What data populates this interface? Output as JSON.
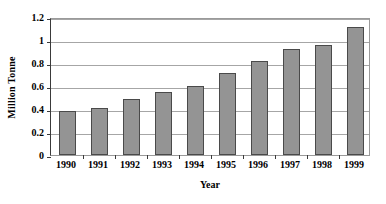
{
  "chart_data": {
    "type": "bar",
    "title": "",
    "xlabel": "Year",
    "ylabel": "Million Tonne",
    "categories": [
      "1990",
      "1991",
      "1992",
      "1993",
      "1994",
      "1995",
      "1996",
      "1997",
      "1998",
      "1999"
    ],
    "values": [
      0.385,
      0.405,
      0.49,
      0.55,
      0.6,
      0.71,
      0.815,
      0.925,
      0.96,
      1.11
    ],
    "series": [
      {
        "name": "Million Tonne",
        "values": [
          0.385,
          0.405,
          0.49,
          0.55,
          0.6,
          0.71,
          0.815,
          0.925,
          0.96,
          1.11
        ]
      }
    ],
    "ylim": [
      0,
      1.2
    ],
    "ytick_values": [
      0,
      0.2,
      0.4,
      0.6,
      0.8,
      1,
      1.2
    ],
    "ytick_labels": [
      "0",
      "0.2",
      "0.4",
      "0.6",
      "0.8",
      "1",
      "1.2"
    ],
    "grid": "horizontal",
    "legend": "none",
    "bar_color": "#949494",
    "bar_border_color": "#4a4a4a",
    "gridline_color": "#a6a6a6",
    "axis_color": "#3a3a3a",
    "background_color": "#ffffff"
  }
}
